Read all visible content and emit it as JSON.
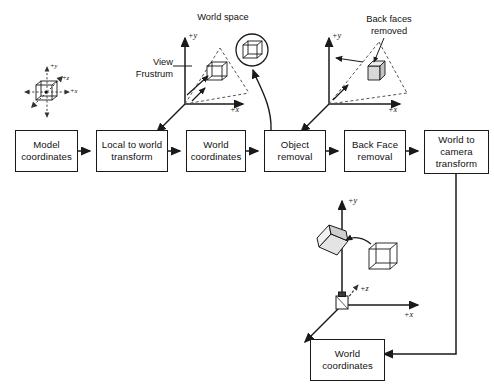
{
  "diagram": {
    "stroke_color": "#1a1a1a",
    "dash_color": "#555555",
    "cube_fill": "#d8d8d8",
    "background": "#ffffff"
  },
  "pipeline": {
    "boxes": [
      {
        "id": "model-coordinates",
        "label": "Model\ncoordinates"
      },
      {
        "id": "local-to-world-transform",
        "label": "Local to world\ntransform"
      },
      {
        "id": "world-coordinates",
        "label": "World\ncoordinates"
      },
      {
        "id": "object-removal",
        "label": "Object\nremoval"
      },
      {
        "id": "back-face-removal",
        "label": "Back Face\nremoval"
      },
      {
        "id": "world-to-camera-transform",
        "label": "World to camera\ntransform"
      }
    ],
    "final_box": {
      "id": "world-coordinates-final",
      "label": "World\ncoordinates"
    }
  },
  "annotations": {
    "world_space": "World space",
    "view_frustrum": "View\nFrustrum",
    "back_faces_removed": "Back faces\nremoved"
  },
  "axis_labels": {
    "plus_x": "+x",
    "plus_y": "+y",
    "plus_z": "+z"
  },
  "model_axes": {
    "plus_x": "+x",
    "plus_y": "+y",
    "plus_z": "+z"
  },
  "camera_axes": {
    "plus_x": "+x",
    "plus_y": "+y",
    "plus_z": "+z"
  }
}
